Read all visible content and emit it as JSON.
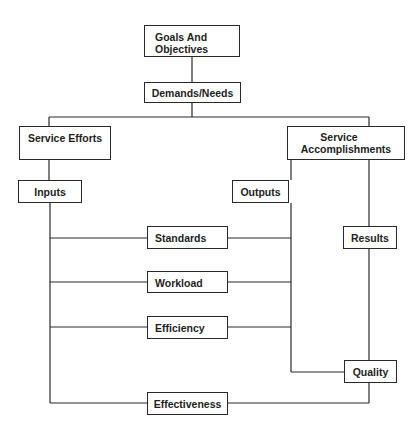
{
  "diagram": {
    "type": "flowchart",
    "line_color": "#2a2a2a",
    "nodes": {
      "goals": {
        "label": "Goals And Objectives",
        "line1": "Goals And",
        "line2": "Objectives"
      },
      "demands": {
        "label": "Demands/Needs"
      },
      "service_efforts": {
        "label": "Service Efforts"
      },
      "service_accomplishments": {
        "label": "Service Accomplishments",
        "line1": "Service",
        "line2": "Accomplishments"
      },
      "inputs": {
        "label": "Inputs"
      },
      "outputs": {
        "label": "Outputs"
      },
      "results": {
        "label": "Results"
      },
      "standards": {
        "label": "Standards"
      },
      "workload": {
        "label": "Workload"
      },
      "efficiency": {
        "label": "Efficiency"
      },
      "quality": {
        "label": "Quality"
      },
      "effectiveness": {
        "label": "Effectiveness"
      }
    },
    "edges": [
      [
        "Goals And Objectives",
        "Demands/Needs"
      ],
      [
        "Demands/Needs",
        "Service Efforts"
      ],
      [
        "Demands/Needs",
        "Service Accomplishments"
      ],
      [
        "Service Efforts",
        "Inputs"
      ],
      [
        "Service Accomplishments",
        "Outputs"
      ],
      [
        "Service Accomplishments",
        "Results"
      ],
      [
        "Inputs",
        "Standards"
      ],
      [
        "Outputs",
        "Standards"
      ],
      [
        "Inputs",
        "Workload"
      ],
      [
        "Outputs",
        "Workload"
      ],
      [
        "Inputs",
        "Efficiency"
      ],
      [
        "Outputs",
        "Efficiency"
      ],
      [
        "Outputs",
        "Quality"
      ],
      [
        "Results",
        "Quality"
      ],
      [
        "Inputs",
        "Effectiveness"
      ],
      [
        "Quality",
        "Effectiveness"
      ]
    ]
  }
}
